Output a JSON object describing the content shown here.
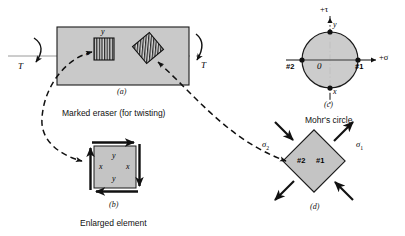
{
  "figure": {
    "colors": {
      "bar_fill": "#c9c9c9",
      "element_fill": "#c4c4c4",
      "circle_fill": "#c9c9c9",
      "stroke": "#1a1a1a",
      "axis_gray": "#8c8c8c",
      "hatch": "#2a2a2a"
    }
  },
  "panel_a": {
    "tag": "(a)",
    "caption": "Marked eraser (for twisting)",
    "torque_left_label": "T",
    "torque_right_label": "T",
    "element_x_label": "x",
    "element_y_label": "y"
  },
  "panel_b": {
    "tag": "(b)",
    "caption": "Enlarged element",
    "labels": {
      "top": "y",
      "left": "x",
      "right": "x",
      "bottom": "y"
    }
  },
  "panel_c": {
    "tag": "(c)",
    "caption": "Mohr's circle",
    "axis_tau": "+τ",
    "axis_sigma": "+σ",
    "origin": "0",
    "point_left": "#2",
    "point_right": "#1",
    "point_top": "y",
    "point_bottom": "x"
  },
  "panel_d": {
    "tag": "(d)",
    "sigma_1": "σ",
    "sigma_1_sub": "1",
    "sigma_2": "σ",
    "sigma_2_sub": "2",
    "face_left": "#2",
    "face_right": "#1"
  }
}
